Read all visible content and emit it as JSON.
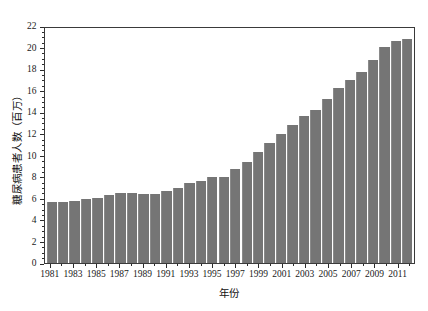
{
  "chart_data": {
    "type": "bar",
    "title": "",
    "subtitle": "",
    "xlabel": "年份",
    "ylabel": "糖尿病患者人数（百万）",
    "ylim": [
      0,
      22
    ],
    "ytick_step": 2,
    "yticks": [
      0,
      2,
      4,
      6,
      8,
      10,
      12,
      14,
      16,
      18,
      20,
      22
    ],
    "yminor_step": 0.5,
    "grid": false,
    "legend": null,
    "bar_color": "#757575",
    "frame_color": "#3a3a3a",
    "categories": [
      "1981",
      "1982",
      "1983",
      "1984",
      "1985",
      "1986",
      "1987",
      "1988",
      "1989",
      "1990",
      "1991",
      "1992",
      "1993",
      "1994",
      "1995",
      "1996",
      "1997",
      "1998",
      "1999",
      "2000",
      "2001",
      "2002",
      "2003",
      "2004",
      "2005",
      "2006",
      "2007",
      "2008",
      "2009",
      "2010",
      "2011",
      "2012"
    ],
    "xtick_labels": [
      "1981",
      "1983",
      "1985",
      "1987",
      "1989",
      "1991",
      "1993",
      "1995",
      "1997",
      "1999",
      "2001",
      "2003",
      "2005",
      "2007",
      "2009",
      "2011"
    ],
    "values": [
      5.7,
      5.7,
      5.8,
      5.9,
      6.05,
      6.3,
      6.5,
      6.5,
      6.45,
      6.4,
      6.7,
      6.95,
      7.45,
      7.6,
      7.95,
      7.95,
      8.75,
      9.35,
      10.35,
      11.15,
      12.0,
      12.85,
      13.65,
      14.25,
      15.2,
      16.25,
      16.95,
      17.7,
      18.8,
      20.05,
      20.65,
      20.75
    ],
    "xlim_note": "32 bars, 1981 through 2012, labels on odd years"
  }
}
